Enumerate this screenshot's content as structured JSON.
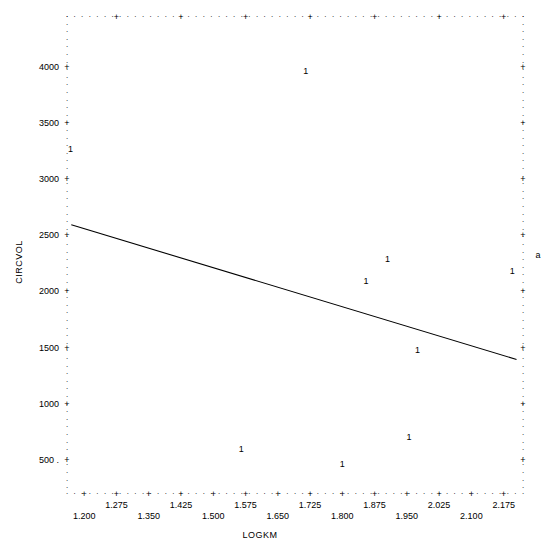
{
  "chart_data": {
    "type": "scatter",
    "title": "",
    "xlabel": "LOGKM",
    "ylabel": "CIRCVOL",
    "point_marker": "1",
    "xlim": [
      1.16,
      2.22
    ],
    "ylim": [
      200,
      4450
    ],
    "grid": false,
    "x_ticks_upper": [
      "1.275",
      "1.425",
      "1.575",
      "1.725",
      "1.875",
      "2.025",
      "2.175"
    ],
    "x_ticks_lower": [
      "1.200",
      "1.350",
      "1.500",
      "1.650",
      "1.800",
      "1.950",
      "2.100"
    ],
    "x_tick_upper_values": [
      1.275,
      1.425,
      1.575,
      1.725,
      1.875,
      2.025,
      2.175
    ],
    "x_tick_lower_values": [
      1.2,
      1.35,
      1.5,
      1.65,
      1.8,
      1.95,
      2.1
    ],
    "y_ticks": [
      "4000",
      "3500",
      "3000",
      "2500",
      "2000",
      "1500",
      "1000",
      "500"
    ],
    "y_tick_values": [
      4000,
      3500,
      3000,
      2500,
      2000,
      1500,
      1000,
      500
    ],
    "points": [
      {
        "x": 1.715,
        "y": 3960,
        "label": "1"
      },
      {
        "x": 1.168,
        "y": 3270,
        "label": "1"
      },
      {
        "x": 1.905,
        "y": 2290,
        "label": "1"
      },
      {
        "x": 1.855,
        "y": 2090,
        "label": "1"
      },
      {
        "x": 2.195,
        "y": 2180,
        "label": "1"
      },
      {
        "x": 1.975,
        "y": 1480,
        "label": "1"
      },
      {
        "x": 1.955,
        "y": 700,
        "label": "1"
      },
      {
        "x": 1.565,
        "y": 600,
        "label": "1"
      },
      {
        "x": 1.8,
        "y": 460,
        "label": "1"
      }
    ],
    "regression_line": {
      "x1": 1.17,
      "y1": 2590,
      "x2": 2.205,
      "y2": 1390
    },
    "series_name": "CIRCVOL vs LOGKM",
    "stray_glyph": "a"
  },
  "axis": {
    "y_title": "CIRCVOL",
    "x_title": "LOGKM"
  }
}
